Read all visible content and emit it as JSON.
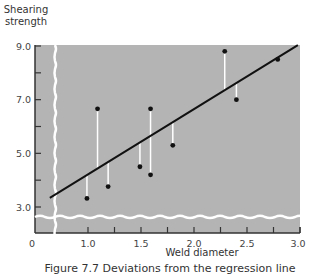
{
  "chart_data": {
    "type": "scatter",
    "title": "",
    "xlabel": "Weld diameter",
    "ylabel": "Shearing strength",
    "xlim": [
      0,
      3.0
    ],
    "ylim": [
      0,
      9.0
    ],
    "x_ticks": [
      0,
      1.0,
      1.5,
      2.0,
      2.5,
      3.0
    ],
    "x_tick_labels": [
      "0",
      "1.0",
      "1.5",
      "2.0",
      "2.5",
      "3.0"
    ],
    "x_minor_ticks": [
      1.25,
      1.75,
      2.25,
      2.75
    ],
    "y_ticks": [
      3.0,
      5.0,
      7.0,
      9.0
    ],
    "y_tick_labels": [
      "3.0",
      "5.0",
      "7.0",
      "9.0"
    ],
    "y_minor_ticks": [
      4.0,
      6.0,
      8.0
    ],
    "grid": false,
    "axis_breaks": {
      "x": true,
      "y": true
    },
    "points": [
      {
        "x": 0.99,
        "y": 3.32
      },
      {
        "x": 1.09,
        "y": 6.66
      },
      {
        "x": 1.19,
        "y": 3.76
      },
      {
        "x": 1.49,
        "y": 4.5
      },
      {
        "x": 1.59,
        "y": 6.66
      },
      {
        "x": 1.59,
        "y": 4.2
      },
      {
        "x": 1.8,
        "y": 5.3
      },
      {
        "x": 2.29,
        "y": 8.8
      },
      {
        "x": 2.4,
        "y": 7.0
      },
      {
        "x": 2.79,
        "y": 8.5
      }
    ],
    "regression_line": {
      "x": [
        0.64,
        2.98
      ],
      "y": [
        3.34,
        9.03
      ]
    },
    "residual_lines": true,
    "caption": "Figure 7.7 Deviations from the regression line"
  },
  "colors": {
    "plot_background": "#b4b4b4",
    "points": "#111111",
    "line": "#111111",
    "residuals": "#ffffff",
    "break_lines": "#ffffff",
    "axis": "#333333"
  }
}
